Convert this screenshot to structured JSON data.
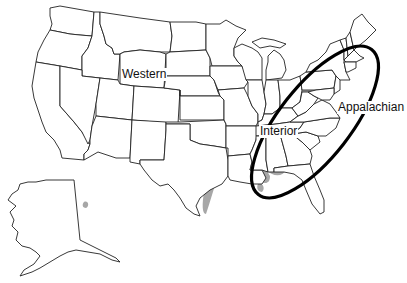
{
  "map": {
    "subject": "United States coal regions",
    "regions": [
      {
        "name": "Western",
        "label": "Western"
      },
      {
        "name": "Interior",
        "label": "Interior"
      },
      {
        "name": "Appalachian",
        "label": "Appalachian"
      }
    ],
    "colors": {
      "coal_deposit": "#a7a7a7",
      "state_outline": "#222222",
      "highlight_ellipse": "#000000",
      "background": "#ffffff"
    },
    "highlighted_region": "Appalachian"
  }
}
